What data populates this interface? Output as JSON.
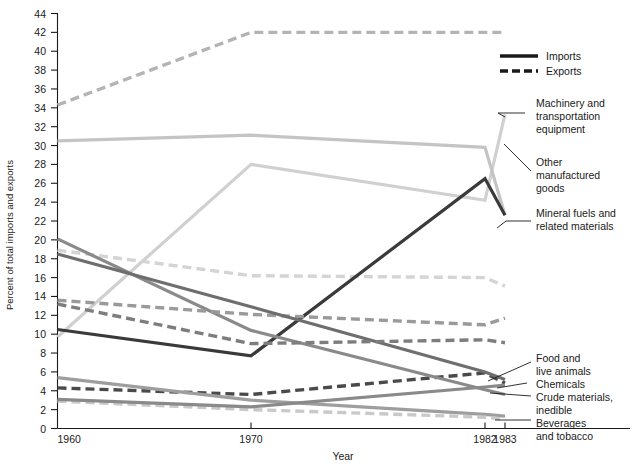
{
  "chart_data": {
    "type": "line",
    "title": "",
    "xlabel": "Year",
    "ylabel": "Percent of total imports and exports",
    "x": [
      1960,
      1970,
      1982,
      1983
    ],
    "xticklabels": [
      "1960",
      "1970",
      "1982",
      "1983"
    ],
    "yticks": [
      0,
      2,
      4,
      6,
      8,
      10,
      12,
      14,
      16,
      18,
      20,
      22,
      24,
      26,
      28,
      30,
      32,
      34,
      36,
      38,
      40,
      42,
      44
    ],
    "yticklabels": [
      "0",
      "2",
      "4",
      "6",
      "8",
      "10",
      "12",
      "14",
      "16",
      "18",
      "20",
      "22",
      "24",
      "26",
      "28",
      "30",
      "32",
      "34",
      "36",
      "38",
      "40",
      "42",
      "44"
    ],
    "ylim": [
      0,
      44
    ],
    "xlim": [
      1960,
      1983
    ],
    "grid": false,
    "legend_position": "top-right",
    "legend": [
      {
        "label": "Imports",
        "style": "solid"
      },
      {
        "label": "Exports",
        "style": "dashed"
      }
    ],
    "series": [
      {
        "name": "Machinery and transportation equipment",
        "flow": "Exports",
        "style": "dashed",
        "color": "#b4b4b4",
        "width": 3.4,
        "values": [
          34.3,
          42.0,
          42.0,
          42.0
        ]
      },
      {
        "name": "Machinery and transportation equipment",
        "flow": "Imports",
        "style": "solid",
        "color": "#d0d0d0",
        "width": 3.2,
        "values": [
          9.7,
          28.0,
          24.2,
          33.3
        ]
      },
      {
        "name": "Other manufactured goods",
        "flow": "Imports",
        "style": "solid",
        "color": "#c4c4c4",
        "width": 3.2,
        "values": [
          30.5,
          31.1,
          29.8,
          22.6
        ]
      },
      {
        "name": "Other manufactured goods",
        "flow": "Exports",
        "style": "dashed",
        "color": "#d4d4d4",
        "width": 3.4,
        "values": [
          18.9,
          16.2,
          16.0,
          15.1
        ]
      },
      {
        "name": "Mineral fuels and related materials",
        "flow": "Imports",
        "style": "solid",
        "color": "#3a3a3a",
        "width": 3.2,
        "values": [
          10.5,
          7.7,
          26.5,
          22.6
        ]
      },
      {
        "name": "Mineral fuels and related materials",
        "flow": "Exports",
        "style": "dashed",
        "color": "#4a4a4a",
        "width": 3.4,
        "values": [
          4.3,
          3.6,
          5.9,
          4.8
        ]
      },
      {
        "name": "Crude materials, inedible",
        "flow": "Imports",
        "style": "solid",
        "color": "#8a8a8a",
        "width": 3.2,
        "values": [
          20.1,
          10.4,
          4.1,
          3.6
        ]
      },
      {
        "name": "Crude materials, inedible",
        "flow": "Exports",
        "style": "dashed",
        "color": "#9a9a9a",
        "width": 3.4,
        "values": [
          13.6,
          12.1,
          11.0,
          11.7
        ]
      },
      {
        "name": "Food and live animals",
        "flow": "Imports",
        "style": "solid",
        "color": "#6e6e6e",
        "width": 3.2,
        "values": [
          18.5,
          12.9,
          6.0,
          5.2
        ]
      },
      {
        "name": "Food and live animals",
        "flow": "Exports",
        "style": "dashed",
        "color": "#7d7d7d",
        "width": 3.4,
        "values": [
          13.2,
          9.0,
          9.4,
          9.1
        ]
      },
      {
        "name": "Beverages and tobacco",
        "flow": "Imports",
        "style": "solid",
        "color": "#9e9e9e",
        "width": 3.2,
        "values": [
          5.4,
          3.0,
          1.5,
          1.3
        ]
      },
      {
        "name": "Beverages and tobacco",
        "flow": "Exports",
        "style": "dashed",
        "color": "#c9c9c9",
        "width": 3.4,
        "values": [
          2.9,
          2.0,
          1.2,
          1.0
        ]
      },
      {
        "name": "Chemicals",
        "flow": "Imports",
        "style": "solid",
        "color": "#8a8a8a",
        "width": 3.2,
        "values": [
          3.1,
          2.3,
          4.4,
          4.6
        ]
      }
    ],
    "annotations": [
      {
        "id": "ann-machinery",
        "lines": [
          "Machinery and",
          "transportation",
          "equipment"
        ]
      },
      {
        "id": "ann-other-manufactured",
        "lines": [
          "Other",
          "manufactured",
          "goods"
        ]
      },
      {
        "id": "ann-mineral-fuels",
        "lines": [
          "Mineral fuels and",
          "related materials"
        ]
      },
      {
        "id": "ann-food",
        "lines": [
          "Food and",
          "live animals"
        ]
      },
      {
        "id": "ann-chemicals",
        "lines": [
          "Chemicals"
        ]
      },
      {
        "id": "ann-crude",
        "lines": [
          "Crude materials,",
          "inedible"
        ]
      },
      {
        "id": "ann-beverages",
        "lines": [
          "Beverages",
          "and tobacco"
        ]
      }
    ]
  }
}
